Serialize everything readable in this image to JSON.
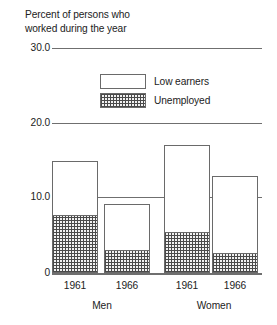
{
  "chart_data": {
    "type": "bar",
    "title": "Percent of persons who\nworked during the year",
    "subtitle": "",
    "xlabel": "",
    "ylabel": "",
    "stacked": true,
    "grid": true,
    "legend_position": "inside-top-center",
    "ylim": [
      0,
      30
    ],
    "yticks": [
      "0",
      "10.0",
      "20.0",
      "30.0"
    ],
    "ytick_values": [
      0,
      10,
      20,
      30
    ],
    "categories": [
      "1961",
      "1966",
      "1961",
      "1966"
    ],
    "groups": [
      {
        "label": "Men",
        "categories": [
          "1961",
          "1966"
        ]
      },
      {
        "label": "Women",
        "categories": [
          "1961",
          "1966"
        ]
      }
    ],
    "series": [
      {
        "name": "Low earners",
        "values": [
          7.4,
          6.2,
          11.8,
          10.3
        ]
      },
      {
        "name": "Unemployed",
        "values": [
          7.6,
          3.0,
          5.3,
          2.6
        ]
      }
    ],
    "totals": [
      15.0,
      9.2,
      17.1,
      12.9
    ],
    "bars": [
      {
        "group": "Men",
        "category": "1961",
        "unemployed": 7.6,
        "low_earners": 7.4,
        "total": 15.0
      },
      {
        "group": "Men",
        "category": "1966",
        "unemployed": 3.0,
        "low_earners": 6.2,
        "total": 9.2
      },
      {
        "group": "Women",
        "category": "1961",
        "unemployed": 5.3,
        "low_earners": 11.8,
        "total": 17.1
      },
      {
        "group": "Women",
        "category": "1966",
        "unemployed": 2.6,
        "low_earners": 10.3,
        "total": 12.9
      }
    ]
  },
  "legend": {
    "items": [
      {
        "label": "Low earners",
        "swatch": "empty"
      },
      {
        "label": "Unemployed",
        "swatch": "hatched"
      }
    ]
  },
  "axis": {
    "y": {
      "t30": "30.0",
      "t20": "20.0",
      "t10": "10.0",
      "t0": "0"
    },
    "x": {
      "men_1961": "1961",
      "men_1966": "1966",
      "women_1961": "1961",
      "women_1966": "1966",
      "group_men": "Men",
      "group_women": "Women"
    }
  },
  "colors": {
    "background": "#ffffff",
    "ink": "#222222",
    "rule": "#6f6f6f",
    "bar_outline": "#6a6a6a",
    "hatch": "#4a4a4a",
    "low_earners_fill": "#ffffff",
    "unemployed_fill": "#f2f2f2"
  }
}
